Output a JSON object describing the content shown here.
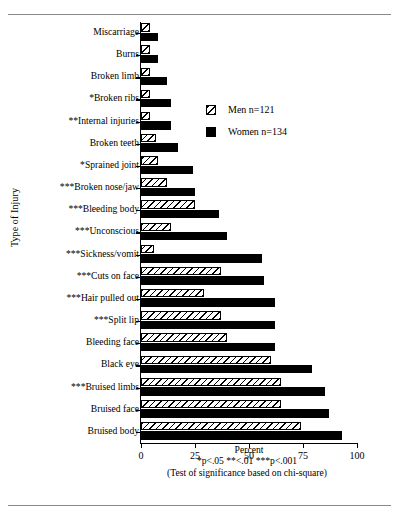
{
  "chart_data": {
    "type": "bar",
    "orientation": "horizontal",
    "title": "",
    "xlabel": "Percent",
    "ylabel": "Type of Injury",
    "xlim": [
      0,
      100
    ],
    "xticks": [
      0,
      25,
      50,
      75,
      100
    ],
    "grid": false,
    "legend_position": "upper right",
    "categories": [
      "Miscarriage",
      "Burns",
      "Broken limb",
      "*Broken ribs",
      "**Internal injuries",
      "Broken teeth",
      "*Sprained joint",
      "***Broken nose/jaw",
      "***Bleeding body",
      "***Unconscious",
      "***Sickness/vomit",
      "***Cuts on face",
      "***Hair pulled out",
      "***Split lip",
      "Bleeding face",
      "Black eye",
      "***Bruised limbs",
      "Bruised face",
      "Bruised body"
    ],
    "series": [
      {
        "name": "Men n=121",
        "pattern": "diagonal-hatch",
        "values": [
          4,
          4,
          4,
          4,
          4,
          7,
          8,
          12,
          25,
          14,
          6,
          37,
          29,
          37,
          40,
          60,
          65,
          65,
          74
        ]
      },
      {
        "name": "Women n=134",
        "pattern": "solid-black",
        "values": [
          8,
          8,
          12,
          14,
          14,
          17,
          24,
          25,
          36,
          40,
          56,
          57,
          62,
          62,
          62,
          79,
          85,
          87,
          93
        ]
      }
    ],
    "footnotes": [
      "Percent",
      "*p<.05  **<.01  ***p<.001",
      "(Test of significance based on chi-square)"
    ]
  },
  "legend": {
    "men_label": "Men n=121",
    "women_label": "Women n=134"
  },
  "axis": {
    "y_title": "Type of Injury",
    "x_title": "Percent",
    "tick_labels": [
      "0",
      "25",
      "50",
      "75",
      "100"
    ]
  },
  "footer": {
    "line1": "Percent",
    "line2": "*p<.05 **<.01 ***p<.001",
    "line3": "(Test of significance based on chi-square)"
  },
  "colors": {
    "bar_women": "#000000",
    "bar_men_fill": "#ffffff",
    "hatch": "#000000",
    "rule": "#8a8a8a"
  }
}
